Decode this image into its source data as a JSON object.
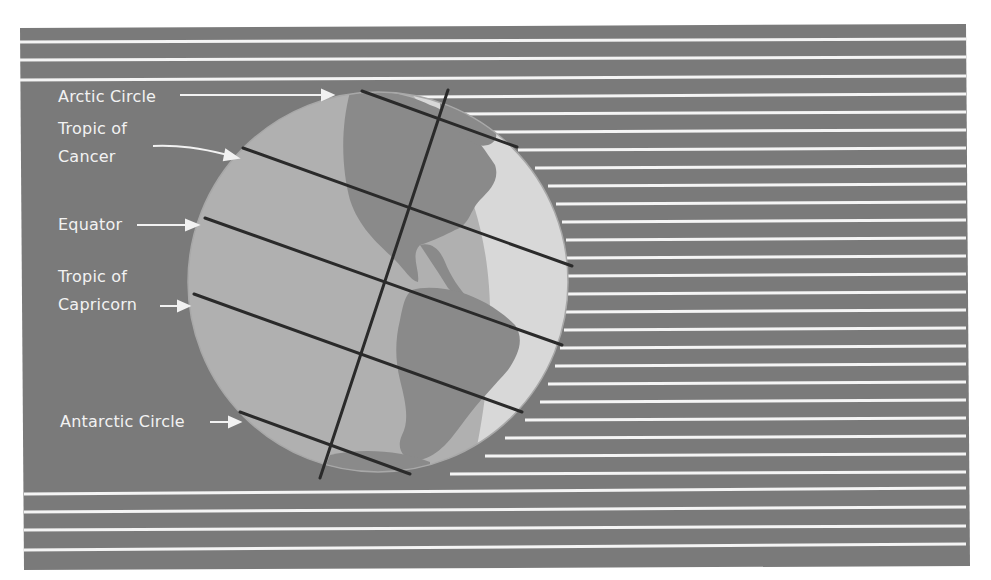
{
  "figure": {
    "colors": {
      "background": "#7a7a7a",
      "rays": "#f4f4f4",
      "ocean_lit": "#b4b4b4",
      "ocean_shade": "#9c9c9c",
      "land": "#8c8c8c",
      "land_lit": "#e2e2e2",
      "lines": "#2a2a2a",
      "label_text": "#f2f2f2"
    },
    "labels": {
      "arctic": "Arctic Circle",
      "cancer_1": "Tropic of",
      "cancer_2": "Cancer",
      "equator": "Equator",
      "capricorn_1": "Tropic of",
      "capricorn_2": "Capricorn",
      "antarctic": "Antarctic Circle"
    }
  }
}
